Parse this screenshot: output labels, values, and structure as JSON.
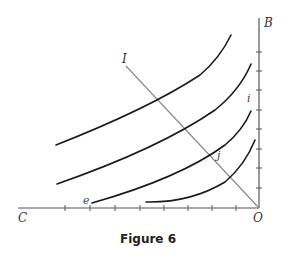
{
  "figure": {
    "caption": "Figure 6",
    "labels": {
      "B": "B",
      "C": "C",
      "O": "O",
      "I": "I",
      "i": "i",
      "j": "j",
      "e": "e"
    },
    "axes": {
      "horizontal": {
        "from_label": "C",
        "to_label": "O",
        "tick_count": 8
      },
      "vertical": {
        "from_label": "O",
        "to_label": "B",
        "tick_count": 8
      }
    },
    "curves": [
      {
        "name": "curve-1",
        "label": ""
      },
      {
        "name": "curve-2",
        "label": ""
      },
      {
        "name": "curve-3",
        "label": "i",
        "start_label": "e"
      },
      {
        "name": "curve-4",
        "label": ""
      }
    ],
    "line": {
      "name": "line-IO",
      "from_label": "I",
      "to_label": "O",
      "marked_point": "j"
    },
    "colors": {
      "curve": "#1a1a1a",
      "axis": "#555555",
      "diagonal": "#8a8a8a",
      "background": "#ffffff"
    }
  }
}
